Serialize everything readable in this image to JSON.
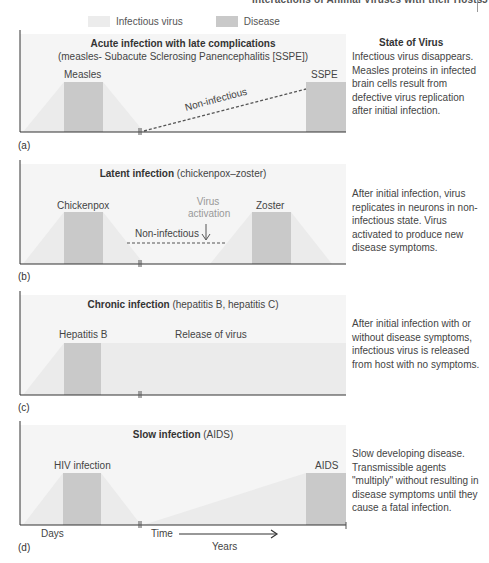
{
  "page_header": {
    "title": "Interactions of Animal Viruses with their Hosts",
    "page_number": "5"
  },
  "legend": {
    "infectious_virus": "Infectious virus",
    "disease": "Disease"
  },
  "colors": {
    "infectious_virus": "#ececec",
    "disease": "#c9c9c9",
    "axis": "#333333"
  },
  "state_column_title": "State of Virus",
  "panels": [
    {
      "id": "a",
      "label": "(a)",
      "title_bold": "Acute infection with late complications",
      "title_rest": "",
      "subtitle": "(measles- Subacute Sclerosing Panencephalitis [SSPE])",
      "events": [
        "Measles",
        "SSPE"
      ],
      "annotation": "Non-infectious",
      "description": "Infectious virus disappears. Measles proteins in infected brain cells result from defective virus replication after initial infection."
    },
    {
      "id": "b",
      "label": "(b)",
      "title_bold": "Latent infection",
      "title_rest": " (chickenpox–zoster)",
      "events": [
        "Chickenpox",
        "Zoster"
      ],
      "annotation": "Non-infectious",
      "annotation2": "Virus activation",
      "description": "After initial infection, virus replicates in neurons in non-infectious state. Virus activated to produce new disease symptoms."
    },
    {
      "id": "c",
      "label": "(c)",
      "title_bold": "Chronic infection",
      "title_rest": " (hepatitis B, hepatitis C)",
      "events": [
        "Hepatitis B"
      ],
      "annotation": "Release of virus",
      "description": "After initial infection with or without disease symptoms, infectious virus is released from host with no symptoms."
    },
    {
      "id": "d",
      "label": "(d)",
      "title_bold": "Slow infection",
      "title_rest": " (AIDS)",
      "events": [
        "HIV infection",
        "AIDS"
      ],
      "description": "Slow developing disease. Transmissible agents \"multiply\" without resulting in disease symptoms until they cause a fatal infection.",
      "axis": {
        "days": "Days",
        "time": "Time",
        "years": "Years"
      }
    }
  ]
}
